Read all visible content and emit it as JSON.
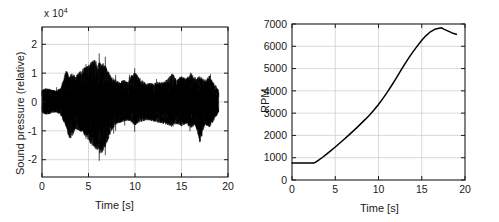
{
  "figure": {
    "background": "#ffffff",
    "axis_color": "#1a1a1a",
    "grid_color": "#c8c8c8",
    "trace_color": "#000000"
  },
  "chart_data": [
    {
      "type": "line",
      "name": "sound-pressure-waveform",
      "title": "",
      "xlabel": "Time [s]",
      "ylabel": "Sound pressure (relative)",
      "exponent_label": "x 10",
      "exponent_power": "4",
      "y_scale_factor": 10000,
      "xlim": [
        0,
        20
      ],
      "ylim": [
        -2.6,
        2.6
      ],
      "xticks": [
        0,
        5,
        10,
        15,
        20
      ],
      "xticklabels": [
        "0",
        "5",
        "10",
        "15",
        "20"
      ],
      "yticks": [
        -2,
        -1,
        0,
        1,
        2
      ],
      "yticklabels": [
        "-2",
        "-1",
        "0",
        "1",
        "2"
      ],
      "grid": true,
      "legend": "none",
      "signal_extent_seconds": [
        0,
        19
      ],
      "envelope_x": [
        0.0,
        0.5,
        1.0,
        1.5,
        2.0,
        2.3,
        2.6,
        2.9,
        3.2,
        3.6,
        4.0,
        4.4,
        4.8,
        5.2,
        5.6,
        6.0,
        6.4,
        6.8,
        7.2,
        7.6,
        8.0,
        8.4,
        8.8,
        9.2,
        9.6,
        10.0,
        10.4,
        10.8,
        11.2,
        11.6,
        12.0,
        12.5,
        13.0,
        13.5,
        14.0,
        14.5,
        15.0,
        15.5,
        16.0,
        16.5,
        17.0,
        17.5,
        18.0,
        18.5,
        19.0
      ],
      "envelope_upper": [
        0.55,
        0.6,
        0.55,
        0.5,
        0.6,
        1.0,
        1.45,
        1.1,
        1.25,
        1.15,
        1.3,
        1.45,
        1.55,
        1.7,
        1.85,
        1.7,
        1.75,
        1.6,
        1.3,
        1.05,
        0.95,
        0.85,
        1.0,
        0.85,
        1.15,
        1.3,
        1.1,
        0.95,
        0.8,
        0.85,
        0.8,
        0.9,
        0.85,
        1.0,
        1.25,
        0.95,
        1.15,
        1.0,
        1.3,
        1.0,
        1.15,
        0.95,
        1.15,
        0.85,
        0.5
      ],
      "envelope_lower": [
        -0.5,
        -0.55,
        -0.5,
        -0.45,
        -0.55,
        -0.85,
        -1.1,
        -1.6,
        -1.55,
        -1.2,
        -1.25,
        -1.35,
        -1.55,
        -1.8,
        -2.0,
        -2.15,
        -2.3,
        -1.95,
        -1.55,
        -1.15,
        -1.0,
        -0.9,
        -0.85,
        -0.8,
        -0.9,
        -1.05,
        -0.9,
        -0.85,
        -0.8,
        -0.8,
        -0.85,
        -0.9,
        -0.95,
        -1.0,
        -1.1,
        -0.95,
        -1.05,
        -0.95,
        -1.15,
        -1.0,
        -1.8,
        -1.0,
        -1.1,
        -0.8,
        -0.45
      ]
    },
    {
      "type": "line",
      "name": "engine-speed-curve",
      "title": "",
      "xlabel": "Time [s]",
      "ylabel": "RPM",
      "xlim": [
        0,
        20
      ],
      "ylim": [
        0,
        7000
      ],
      "xticks": [
        0,
        5,
        10,
        15,
        20
      ],
      "xticklabels": [
        "0",
        "5",
        "10",
        "15",
        "20"
      ],
      "yticks": [
        0,
        1000,
        2000,
        3000,
        4000,
        5000,
        6000,
        7000
      ],
      "yticklabels": [
        "0",
        "1000",
        "2000",
        "3000",
        "4000",
        "5000",
        "6000",
        "7000"
      ],
      "grid": true,
      "legend": "none",
      "x": [
        0.0,
        0.5,
        1.0,
        1.5,
        2.0,
        2.5,
        2.7,
        3.0,
        3.5,
        4.0,
        4.5,
        5.0,
        5.5,
        6.0,
        6.5,
        7.0,
        7.5,
        8.0,
        8.5,
        9.0,
        9.5,
        10.0,
        10.5,
        11.0,
        11.5,
        12.0,
        12.5,
        13.0,
        13.5,
        14.0,
        14.5,
        15.0,
        15.5,
        16.0,
        16.5,
        17.0,
        17.3,
        17.6,
        18.0,
        18.5,
        19.0
      ],
      "values": [
        760,
        760,
        760,
        760,
        760,
        760,
        790,
        870,
        1010,
        1160,
        1320,
        1480,
        1650,
        1820,
        1990,
        2170,
        2350,
        2540,
        2730,
        2930,
        3150,
        3390,
        3650,
        3930,
        4230,
        4540,
        4860,
        5180,
        5480,
        5760,
        6020,
        6270,
        6480,
        6650,
        6760,
        6810,
        6830,
        6760,
        6690,
        6600,
        6540
      ]
    }
  ],
  "sound_panel": {
    "xlabel": "Time [s]",
    "ylabel": "Sound pressure (relative)",
    "exponent": "x 10",
    "exponent_power": "4"
  },
  "rpm_panel": {
    "xlabel": "Time [s]",
    "ylabel": "RPM"
  }
}
